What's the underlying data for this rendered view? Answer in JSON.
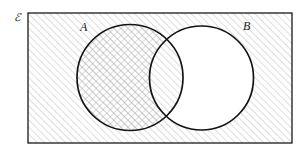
{
  "figure": {
    "name": "venn-diagram-two-sets",
    "background_color": "#ffffff",
    "stroke_color": "#1a1a1a",
    "hatch_color": "#b4b4b4"
  },
  "labels": {
    "universe": "ℰ",
    "set_a": "A",
    "set_b": "B"
  },
  "universe_rect": {
    "x": 28,
    "y": 13,
    "width": 264,
    "height": 130,
    "stroke_width": 1.3,
    "fill": "hatch-single"
  },
  "circles": [
    {
      "id": "circle-a",
      "label": "A",
      "cx": 130,
      "cy": 77.5,
      "r": 53,
      "stroke_width": 1.6,
      "fill": "hatch-cross"
    },
    {
      "id": "circle-b",
      "label": "B",
      "cx": 201.5,
      "cy": 78,
      "r": 52,
      "stroke_width": 1.6,
      "fill": "white"
    }
  ],
  "regions": {
    "outside_both": "hatch-single",
    "a_only": "hatch-cross",
    "intersection": "hatch-single",
    "b_only": "white"
  },
  "label_positions": {
    "universe": {
      "x": 14,
      "y": 21,
      "font_size": 11
    },
    "set_a": {
      "x": 80,
      "y": 31,
      "font_size": 12
    },
    "set_b": {
      "x": 243,
      "y": 30,
      "font_size": 12
    }
  },
  "hatching": {
    "single_angle_deg": 45,
    "cross_angles_deg": [
      45,
      135
    ],
    "spacing_px": 5,
    "line_width": 0.8
  }
}
